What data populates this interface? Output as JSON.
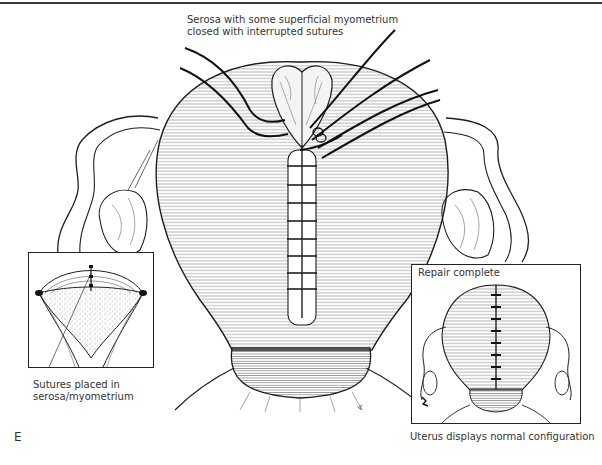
{
  "figure": {
    "panel_letter": "E",
    "top_label": {
      "line1": "Serosa with some superficial myometrium",
      "line2": "closed with interrupted sutures"
    },
    "left_inset": {
      "caption_line1": "Sutures placed in",
      "caption_line2": "serosa/myometrium"
    },
    "right_inset": {
      "title": "Repair complete",
      "caption": "Uterus displays normal configuration"
    }
  },
  "colors": {
    "ink": "#1e1e1e",
    "hatch": "#6a6a6a",
    "stipple": "#8a8a8a",
    "background": "#ffffff"
  }
}
